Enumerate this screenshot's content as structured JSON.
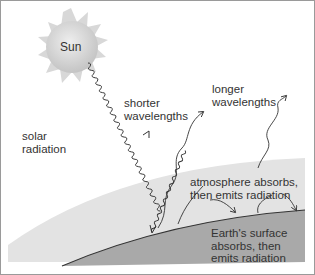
{
  "diagram": {
    "labels": {
      "sun": "Sun",
      "solar_radiation": "solar\nradiation",
      "shorter_wavelengths": "shorter\nwavelengths",
      "longer_wavelengths": "longer\nwavelengths",
      "atmosphere": "atmosphere absorbs,\nthen emits radiation",
      "earth_surface": "Earth's surface\nabsorbs, then\nemits radiation"
    },
    "colors": {
      "background": "#ffffff",
      "atmosphere": "#e3e3e3",
      "earth": "#a9a9a9",
      "sun_core": "#d2d2d2",
      "sun_rays": "#dcdcdc",
      "line": "#333333",
      "border": "#9a9a9a"
    }
  }
}
